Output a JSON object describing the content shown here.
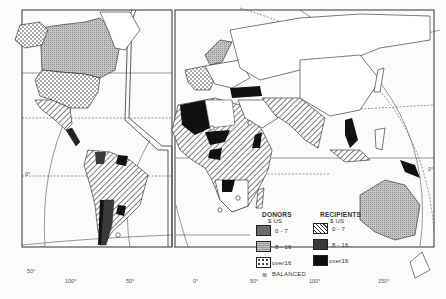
{
  "map": {
    "subject": "World aid flows — donors and recipients",
    "colors": {
      "background": "#fbfbf9",
      "ink": "#222222",
      "donor_low": "#6b6b6b",
      "donor_mid": "#b8b8b8",
      "donor_high_dots": "#ffffff",
      "recipient_low_hatch": "#ffffff",
      "recipient_mid": "#3a3a3a",
      "recipient_high": "#0e0e0e"
    },
    "legend": {
      "donors": {
        "title": "DONORS",
        "unit": "$ US",
        "items": [
          {
            "label": "0 - 7",
            "pattern": "dark-gray"
          },
          {
            "label": "8 - 16",
            "pattern": "light-gray-stipple"
          },
          {
            "label": "over16",
            "pattern": "dots"
          }
        ]
      },
      "recipients": {
        "title": "RECIPIENTS",
        "unit": "$ US",
        "items": [
          {
            "label": "0 - 7",
            "pattern": "diagonal-hatch"
          },
          {
            "label": "8 - 16",
            "pattern": "dark"
          },
          {
            "label": "over16",
            "pattern": "black"
          }
        ]
      },
      "balanced": {
        "symbol": "⊛",
        "label": "BALANCED"
      }
    },
    "graticule_labels": {
      "lat": [
        {
          "label": "0°",
          "side": "left"
        },
        {
          "label": "50°",
          "side": "left"
        },
        {
          "label": "0°",
          "side": "right"
        }
      ],
      "lon": [
        "100°",
        "50°",
        "0°",
        "50°",
        "100°",
        "150°"
      ]
    }
  }
}
